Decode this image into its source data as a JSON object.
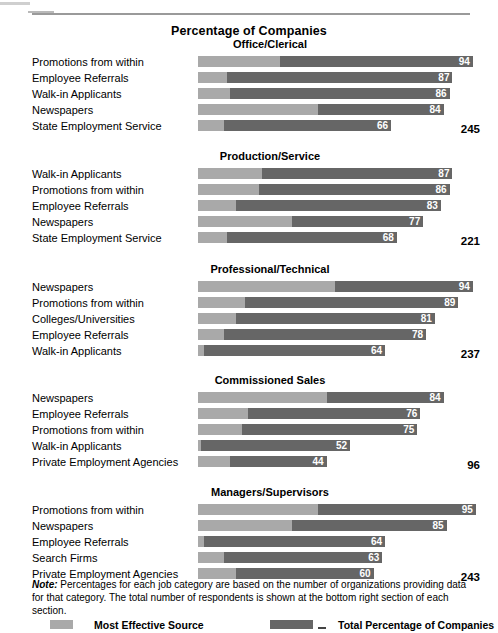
{
  "page": {
    "title": "Percentage of Companies"
  },
  "colors": {
    "most_effective_source": "#a9a9a9",
    "total_percentage": "#666666",
    "rule": "#9a9a9a",
    "value_label": "#ffffff"
  },
  "note": {
    "lead": "Note:",
    "text": " Percentages for each job category are based on the number of organizations providing data for that category. The total number of respondents is shown at the bottom right section of each section."
  },
  "legend": {
    "items": [
      {
        "label": "Most Effective Source",
        "color": "#a9a9a9",
        "swatch": "legend-swatch-light"
      },
      {
        "label": "Total Percentage of Companies",
        "color": "#666666",
        "swatch": "legend-swatch-dark"
      }
    ],
    "dash_glyph": "_"
  },
  "chart_data": {
    "type": "bar",
    "title": "Percentage of Companies",
    "xlabel": "",
    "ylabel": "",
    "xlim": [
      0,
      100
    ],
    "grid": false,
    "orientation": "horizontal",
    "stacked_overlay": true,
    "legend_position": "bottom",
    "series": [
      {
        "name": "Most Effective Source",
        "color": "#a9a9a9"
      },
      {
        "name": "Total Percentage of Companies",
        "color": "#666666"
      }
    ],
    "note": "Percentages for each job category are based on the number of organizations providing data for that category. The total number of respondents is shown at the bottom right section of each section.",
    "sections": [
      {
        "title": "Office/Clerical",
        "respondents": "245",
        "rows": [
          {
            "label": "Promotions from within",
            "total": 94,
            "effective": 28,
            "value_label": "94"
          },
          {
            "label": "Employee Referrals",
            "total": 87,
            "effective": 10,
            "value_label": "87"
          },
          {
            "label": "Walk-in Applicants",
            "total": 86,
            "effective": 11,
            "value_label": "86"
          },
          {
            "label": "Newspapers",
            "total": 84,
            "effective": 41,
            "value_label": "84"
          },
          {
            "label": "State Employment Service",
            "total": 66,
            "effective": 9,
            "value_label": "66"
          }
        ]
      },
      {
        "title": "Production/Service",
        "respondents": "221",
        "rows": [
          {
            "label": "Walk-in Applicants",
            "total": 87,
            "effective": 22,
            "value_label": "87"
          },
          {
            "label": "Promotions from within",
            "total": 86,
            "effective": 21,
            "value_label": "86"
          },
          {
            "label": "Employee Referrals",
            "total": 83,
            "effective": 13,
            "value_label": "83"
          },
          {
            "label": "Newspapers",
            "total": 77,
            "effective": 32,
            "value_label": "77"
          },
          {
            "label": "State Employment Service",
            "total": 68,
            "effective": 10,
            "value_label": "68"
          }
        ]
      },
      {
        "title": "Professional/Technical",
        "respondents": "237",
        "rows": [
          {
            "label": "Newspapers",
            "total": 94,
            "effective": 47,
            "value_label": "94"
          },
          {
            "label": "Promotions from within",
            "total": 89,
            "effective": 16,
            "value_label": "89"
          },
          {
            "label": "Colleges/Universities",
            "total": 81,
            "effective": 13,
            "value_label": "81"
          },
          {
            "label": "Employee Referrals",
            "total": 78,
            "effective": 9,
            "value_label": "78"
          },
          {
            "label": "Walk-in Applicants",
            "total": 64,
            "effective": 2,
            "value_label": "64"
          }
        ]
      },
      {
        "title": "Commissioned Sales",
        "respondents": "96",
        "rows": [
          {
            "label": "Newspapers",
            "total": 84,
            "effective": 44,
            "value_label": "84"
          },
          {
            "label": "Employee Referrals",
            "total": 76,
            "effective": 17,
            "value_label": "76"
          },
          {
            "label": "Promotions from within",
            "total": 75,
            "effective": 15,
            "value_label": "75"
          },
          {
            "label": "Walk-in Applicants",
            "total": 52,
            "effective": 1,
            "value_label": "52"
          },
          {
            "label": "Private Employment Agencies",
            "total": 44,
            "effective": 11,
            "value_label": "44"
          }
        ]
      },
      {
        "title": "Managers/Supervisors",
        "respondents": "243",
        "rows": [
          {
            "label": "Promotions from within",
            "total": 95,
            "effective": 41,
            "value_label": "95"
          },
          {
            "label": "Newspapers",
            "total": 85,
            "effective": 32,
            "value_label": "85"
          },
          {
            "label": "Employee Referrals",
            "total": 64,
            "effective": 2,
            "value_label": "64"
          },
          {
            "label": "Search Firms",
            "total": 63,
            "effective": 9,
            "value_label": "63"
          },
          {
            "label": "Private Employment Agencies",
            "total": 60,
            "effective": 13,
            "value_label": "60"
          }
        ]
      }
    ]
  }
}
